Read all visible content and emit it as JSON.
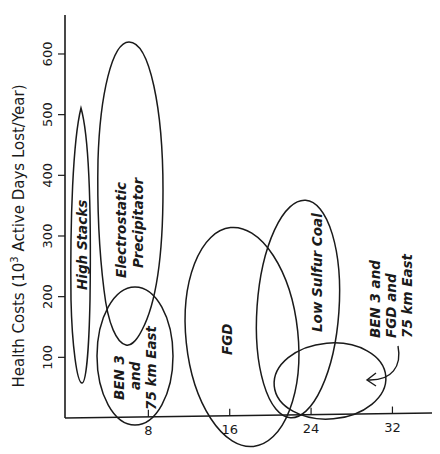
{
  "chart_data": {
    "type": "scatter",
    "title": "",
    "xlabel": "",
    "ylabel": "Health Costs (10^3 Active Days Lost/Year)",
    "ylabel_parts": {
      "main": "Health Costs (10",
      "sup": "3",
      "rest": " Active Days Lost/Year)"
    },
    "xlim": [
      0,
      36
    ],
    "ylim": [
      0,
      660
    ],
    "x_ticks": [
      8,
      16,
      24,
      32
    ],
    "y_ticks": [
      100,
      200,
      300,
      400,
      500,
      600
    ],
    "grid": false,
    "legend": null,
    "series": [
      {
        "name": "High Stacks",
        "shape": "ellipse",
        "x_range": [
          0.4,
          2.4
        ],
        "y_range": [
          58,
          510
        ],
        "label_lines": [
          "High Stacks"
        ]
      },
      {
        "name": "Electrostatic Precipitator",
        "shape": "ellipse",
        "x_range": [
          3.0,
          9.4
        ],
        "y_range": [
          120,
          620
        ],
        "label_lines": [
          "Electrostatic",
          "Precipitator"
        ]
      },
      {
        "name": "BEN 3 and 75 km East",
        "shape": "ellipse",
        "x_range": [
          3.0,
          10.5
        ],
        "y_range": [
          -12,
          216
        ],
        "label_lines": [
          "BEN 3",
          "and",
          "75 km East"
        ]
      },
      {
        "name": "FGD",
        "shape": "ellipse",
        "x_range": [
          11.7,
          22.7
        ],
        "y_range": [
          -45,
          315
        ],
        "label_lines": [
          "FGD"
        ]
      },
      {
        "name": "Low Sulfur Coal",
        "shape": "ellipse",
        "x_range": [
          18.7,
          26.7
        ],
        "y_range": [
          0,
          360
        ],
        "label_lines": [
          "Low Sulfur Coal"
        ]
      },
      {
        "name": "BEN 3 and FGD and 75 km East",
        "shape": "ellipse",
        "x_range": [
          20.4,
          31.4
        ],
        "y_range": [
          -3,
          124
        ],
        "label_lines": [
          "BEN 3 and",
          "FGD  and",
          "75 km East"
        ],
        "annotation": "curved arrow pointing into ellipse"
      }
    ]
  }
}
